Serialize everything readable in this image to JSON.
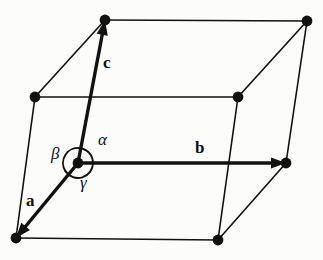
{
  "figure": {
    "name": "crystallographic-unit-cell",
    "width": 323,
    "height": 260,
    "background_color": "#fcfcfa",
    "ink_color": "#111111"
  },
  "style": {
    "edge_width": 1.6,
    "vector_width": 3.4,
    "arc_width": 1.9,
    "vertex_radius": 5.4
  },
  "vertices": [
    {
      "id": "origin",
      "name": "origin-vertex",
      "x": 78,
      "y": 163
    },
    {
      "id": "top_left",
      "name": "top-left-vertex",
      "x": 105,
      "y": 20
    },
    {
      "id": "top_right",
      "name": "top-right-vertex",
      "x": 307,
      "y": 21
    },
    {
      "id": "mid_left",
      "name": "left-middle-vertex",
      "x": 35,
      "y": 97
    },
    {
      "id": "mid_right",
      "name": "back-right-vertex",
      "x": 238,
      "y": 97
    },
    {
      "id": "right",
      "name": "right-vertex",
      "x": 286,
      "y": 163
    },
    {
      "id": "bottom_left",
      "name": "bottom-left-vertex",
      "x": 16,
      "y": 238
    },
    {
      "id": "bottom_right",
      "name": "bottom-right-vertex",
      "x": 218,
      "y": 240
    }
  ],
  "edges": [
    {
      "name": "edge-top-back",
      "from": "top_left",
      "to": "top_right"
    },
    {
      "name": "edge-midleft-topleft",
      "from": "mid_left",
      "to": "top_left"
    },
    {
      "name": "edge-midleft-midright",
      "from": "mid_left",
      "to": "mid_right"
    },
    {
      "name": "edge-midright-topright",
      "from": "mid_right",
      "to": "top_right"
    },
    {
      "name": "edge-midleft-bottomleft",
      "from": "mid_left",
      "to": "bottom_left"
    },
    {
      "name": "edge-topright-right",
      "from": "top_right",
      "to": "right"
    },
    {
      "name": "edge-midright-bottomright",
      "from": "mid_right",
      "to": "bottom_right"
    },
    {
      "name": "edge-bottomleft-bottomright",
      "from": "bottom_left",
      "to": "bottom_right"
    },
    {
      "name": "edge-bottomright-right",
      "from": "bottom_right",
      "to": "right"
    }
  ],
  "vectors": [
    {
      "id": "a",
      "name": "vector-a",
      "label": "a",
      "from": "origin",
      "to": "bottom_left",
      "label_x": 26,
      "label_y": 192
    },
    {
      "id": "b",
      "name": "vector-b",
      "label": "b",
      "from": "origin",
      "to": "right",
      "label_x": 195,
      "label_y": 139
    },
    {
      "id": "c",
      "name": "vector-c",
      "label": "c",
      "from": "origin",
      "to": "top_left",
      "label_x": 103,
      "label_y": 54
    }
  ],
  "angles": [
    {
      "id": "alpha",
      "name": "angle-alpha",
      "label": "α",
      "between": [
        "b",
        "c"
      ],
      "label_x": 98,
      "label_y": 131,
      "arc_start_deg": -79,
      "arc_end_deg": 0,
      "arc_radius": 15
    },
    {
      "id": "beta",
      "name": "angle-beta",
      "label": "β",
      "between": [
        "a",
        "c"
      ],
      "label_x": 51,
      "label_y": 145,
      "arc_start_deg": 146,
      "arc_end_deg": 281,
      "arc_radius": 15
    },
    {
      "id": "gamma",
      "name": "angle-gamma",
      "label": "γ",
      "between": [
        "a",
        "b"
      ],
      "label_x": 80,
      "label_y": 174,
      "arc_start_deg": 0,
      "arc_end_deg": 146,
      "arc_radius": 15
    }
  ]
}
